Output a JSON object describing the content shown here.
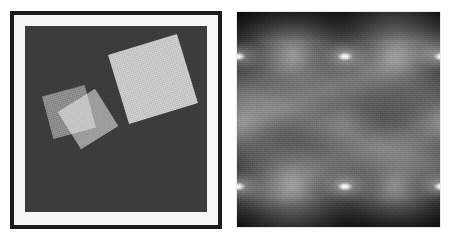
{
  "figure": {
    "title": "",
    "layout": "side-by-side image pair",
    "background_color": "#ffffff",
    "width": 450,
    "height": 240
  },
  "left_panel": {
    "name": "spatial-domain-image",
    "caption": "",
    "frame": {
      "outer_border_color": "#1b1b1b",
      "outer_border_width_px": 4,
      "matte_color": "#f7f7f7",
      "matte_width_px": 11
    },
    "canvas": {
      "background_color": "#3a3a3a",
      "width_px": 182,
      "height_px": 186,
      "texture": "fine film grain"
    },
    "shapes": [
      {
        "id": "sq-large",
        "label": "large rotated square",
        "fill_color": "#cfcfcf",
        "size_px": 72,
        "rotation_deg": -17,
        "x_px": 92,
        "y_px": 17
      },
      {
        "id": "sq-small-a",
        "label": "small rotated square (upper-left of pair)",
        "fill_color": "#8d8d8d",
        "size_px": 44,
        "rotation_deg": -15,
        "x_px": 22,
        "y_px": 64
      },
      {
        "id": "sq-small-b",
        "label": "small rotated square (overlapping)",
        "fill_color": "#8a8a8a",
        "size_px": 44,
        "rotation_deg": -32,
        "x_px": 41,
        "y_px": 71,
        "blend": "screen",
        "note": "overlap with sq-small-a forms a brighter wedge"
      }
    ]
  },
  "right_panel": {
    "name": "fourier-magnitude-spectrum",
    "caption": "",
    "background_color": "#0a0a0a",
    "border_color": "#e9e9e9",
    "width_px": 205,
    "height_px": 217,
    "pattern": "periodic diamond lobes with bright singular peaks on a 3 x 2 lattice",
    "peak_color": "#ffffff",
    "peaks": [
      {
        "x_px": 1,
        "y_px": 44
      },
      {
        "x_px": 108,
        "y_px": 44
      },
      {
        "x_px": 204,
        "y_px": 44
      },
      {
        "x_px": 1,
        "y_px": 174
      },
      {
        "x_px": 108,
        "y_px": 174
      },
      {
        "x_px": 204,
        "y_px": 174
      }
    ],
    "peak_spacing_x_px": 103,
    "peak_spacing_y_px": 130,
    "lobes": [
      {
        "x_px": 55,
        "y_px": 44,
        "scale": 1.15,
        "intensity": 0.85
      },
      {
        "x_px": 158,
        "y_px": 44,
        "scale": 1.1,
        "intensity": 0.8
      },
      {
        "x_px": 5,
        "y_px": 109,
        "scale": 1.05,
        "intensity": 0.72
      },
      {
        "x_px": 108,
        "y_px": 109,
        "scale": 1.2,
        "intensity": 0.62
      },
      {
        "x_px": 205,
        "y_px": 109,
        "scale": 1.05,
        "intensity": 0.7
      },
      {
        "x_px": 55,
        "y_px": 174,
        "scale": 1.15,
        "intensity": 0.82
      },
      {
        "x_px": 158,
        "y_px": 174,
        "scale": 1.1,
        "intensity": 0.78
      },
      {
        "x_px": 55,
        "y_px": 240,
        "scale": 1.0,
        "intensity": 0.55
      },
      {
        "x_px": 158,
        "y_px": -20,
        "scale": 1.0,
        "intensity": 0.55
      }
    ],
    "bands": [
      {
        "y_px": 72,
        "rotation_deg": -22,
        "intensity": 0.55
      },
      {
        "y_px": 118,
        "rotation_deg": 20,
        "intensity": 0.52
      },
      {
        "y_px": 150,
        "rotation_deg": -20,
        "intensity": 0.4
      }
    ]
  }
}
